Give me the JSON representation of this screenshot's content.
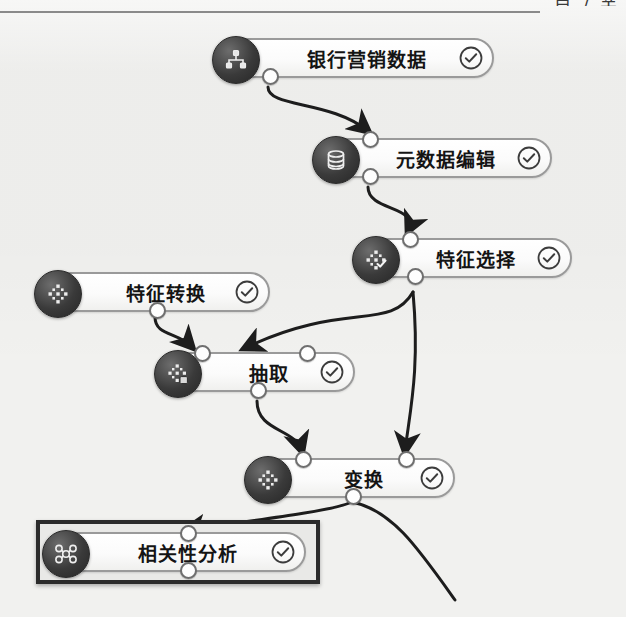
{
  "header": {
    "clipped_text": "自 / 关",
    "divider": true
  },
  "canvas": {
    "background": "#f1f1ef",
    "node_border_color": "#9a9a9a",
    "icon_color": "#2f2f2f",
    "status_color": "#3c3c3c",
    "selection_color": "#2b2b2b"
  },
  "nodes": [
    {
      "id": "bank-marketing-data",
      "label": "银行营销数据",
      "icon": "data-source-icon",
      "status": "check-circle-icon",
      "x": 218,
      "y": 38,
      "w": 276,
      "ports": {
        "top": [],
        "bottom": [
          50
        ]
      },
      "selected": false
    },
    {
      "id": "metadata-edit",
      "label": "元数据编辑",
      "icon": "database-icon",
      "status": "check-circle-icon",
      "x": 318,
      "y": 138,
      "w": 234,
      "ports": {
        "top": [
          50
        ],
        "bottom": [
          50
        ]
      },
      "selected": false
    },
    {
      "id": "feature-selection",
      "label": "特征选择",
      "icon": "feature-select-icon",
      "status": "check-circle-icon",
      "x": 358,
      "y": 238,
      "w": 214,
      "ports": {
        "top": [
          50
        ],
        "bottom": [
          55
        ]
      },
      "selected": false
    },
    {
      "id": "feature-transform",
      "label": "特征转换",
      "icon": "feature-transform-icon",
      "status": "check-circle-icon",
      "x": 40,
      "y": 272,
      "w": 230,
      "ports": {
        "top": [],
        "bottom": [
          50
        ]
      },
      "selected": false
    },
    {
      "id": "extract",
      "label": "抽取",
      "icon": "extract-icon",
      "status": "check-circle-icon",
      "x": 160,
      "y": 352,
      "w": 195,
      "ports": {
        "top": [
          25,
          78
        ],
        "bottom": [
          50
        ]
      },
      "selected": false
    },
    {
      "id": "transform",
      "label": "变换",
      "icon": "transform-icon",
      "status": "check-circle-icon",
      "x": 250,
      "y": 458,
      "w": 205,
      "ports": {
        "top": [
          25,
          80
        ],
        "bottom": [
          50
        ]
      },
      "selected": false
    },
    {
      "id": "correlation-analysis",
      "label": "相关性分析",
      "icon": "correlation-icon",
      "status": "check-circle-icon",
      "x": 48,
      "y": 532,
      "w": 258,
      "ports": {
        "top": [
          50
        ],
        "bottom": [
          50
        ]
      },
      "selected": true
    }
  ],
  "edges": [
    {
      "from": "bank-marketing-data",
      "to": "metadata-edit"
    },
    {
      "from": "metadata-edit",
      "to": "feature-selection"
    },
    {
      "from": "feature-selection",
      "to": "extract"
    },
    {
      "from": "feature-selection",
      "to": "transform"
    },
    {
      "from": "feature-transform",
      "to": "extract"
    },
    {
      "from": "extract",
      "to": "transform"
    },
    {
      "from": "transform",
      "to": "correlation-analysis"
    },
    {
      "from": "transform",
      "to": "offscreen"
    }
  ]
}
